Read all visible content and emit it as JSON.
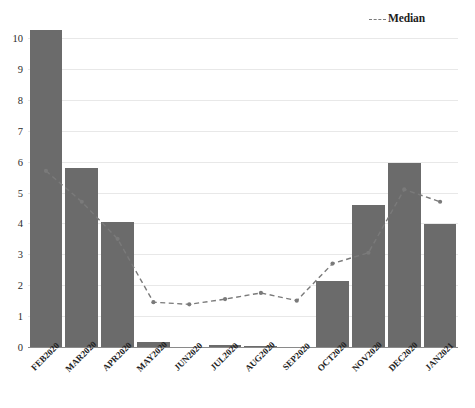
{
  "chart_data": {
    "type": "bar",
    "title": "",
    "subtitle": "",
    "xlabel": "",
    "ylabel": "",
    "ylim": [
      0,
      10
    ],
    "yticks": [
      0,
      1,
      2,
      3,
      4,
      5,
      6,
      7,
      8,
      9,
      10
    ],
    "ytick_labels": [
      "0",
      "1",
      "2",
      "3",
      "4",
      "5",
      "6",
      "7",
      "8",
      "9",
      "10"
    ],
    "grid": true,
    "grid_axis": "y",
    "legend_position": "top-right",
    "categories": [
      "FEB2020",
      "MAR2020",
      "APR2020",
      "MAY2020",
      "JUN2020",
      "JUL2020",
      "AUG2020",
      "SEP2020",
      "OCT2020",
      "NOV2020",
      "DEC2020",
      "JAN2021"
    ],
    "series": [
      {
        "name": "Bars",
        "type": "bar",
        "color": "#6b6b6b",
        "values": [
          10.25,
          5.8,
          4.05,
          0.15,
          0.0,
          0.05,
          0.03,
          0.0,
          2.15,
          4.6,
          5.97,
          3.97
        ]
      },
      {
        "name": "Median",
        "type": "line",
        "style": "dashed",
        "color": "#7a7a7a",
        "marker": "circle",
        "values": [
          5.7,
          4.7,
          3.5,
          1.45,
          1.38,
          1.55,
          1.75,
          1.5,
          2.7,
          3.05,
          5.1,
          4.7
        ]
      }
    ]
  },
  "legend": {
    "median_label": "Median"
  },
  "colors": {
    "bar": "#6b6b6b",
    "median_line": "#7a7a7a",
    "gridline": "#e8e8e8",
    "axis": "#8a8a8a",
    "text": "#232323"
  }
}
